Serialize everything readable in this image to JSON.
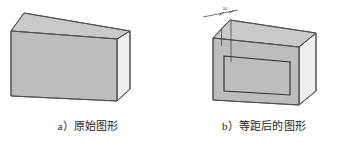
{
  "figure": {
    "background_color": "#ffffff",
    "width": 352,
    "height": 143,
    "stroke_color": "#4d4d4d",
    "inner_stroke_color": "#333333"
  },
  "panels": [
    {
      "id": "original",
      "caption": "a）原始图形",
      "caption_index": "a）",
      "caption_text": "原始图形",
      "shape": {
        "type": "isometric-box",
        "top_face_color": "#c9c9c9",
        "front_face_color": "#bdbdbd",
        "side_face_color": "#efefef",
        "has_offset_outline": false
      }
    },
    {
      "id": "offset",
      "caption": "b）等距后的图形",
      "caption_index": "b）",
      "caption_text": "等距后的图形",
      "shape": {
        "type": "isometric-box",
        "top_face_color": "#c9c9c9",
        "front_face_color": "#bdbdbd",
        "side_face_color": "#efefef",
        "has_offset_outline": true
      },
      "annotation": {
        "label": "10",
        "type": "dimension-leader",
        "line_color": "#3a3a3a"
      }
    }
  ]
}
